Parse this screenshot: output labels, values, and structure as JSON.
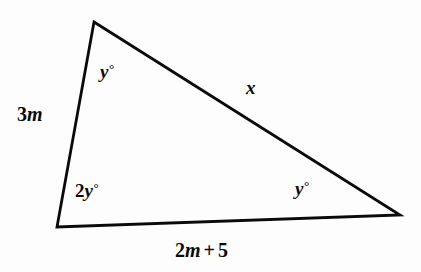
{
  "figure": {
    "kind": "triangle-diagram",
    "stroke_color": "#0a0a0a",
    "background_color": "#fdfdfd",
    "stroke_width": 2.8,
    "vertices": {
      "apex": [
        94,
        22
      ],
      "bottom_left": [
        57,
        227
      ],
      "bottom_right": [
        400,
        215
      ]
    }
  },
  "labels": {
    "angle_top": {
      "coefficient": "",
      "variable": "y",
      "degree": "°",
      "full": "y°"
    },
    "angle_bottom_left": {
      "coefficient": "2",
      "variable": "y",
      "degree": "°",
      "full": "2y°"
    },
    "angle_bottom_right": {
      "coefficient": "",
      "variable": "y",
      "degree": "°",
      "full": "y°"
    },
    "side_left": {
      "number": "3",
      "variable": "m",
      "full": "3m"
    },
    "side_hypotenuse": {
      "variable": "x",
      "full": "x"
    },
    "side_base": {
      "number": "2",
      "variable": "m",
      "operator": "+",
      "constant": "5",
      "full": "2m + 5"
    }
  }
}
